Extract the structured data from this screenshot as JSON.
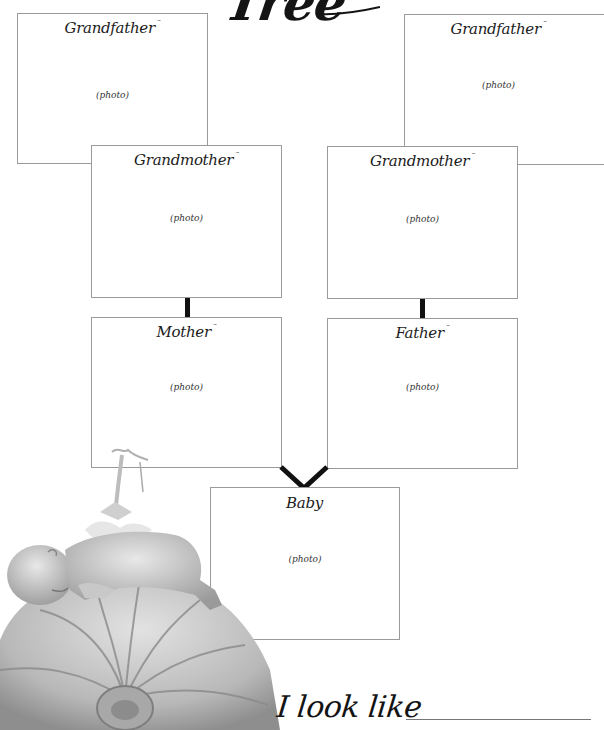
{
  "page": {
    "title": "Tree",
    "footer_prompt": "I look like"
  },
  "boxes": {
    "grandfather_left": {
      "label": "Grandfather",
      "placeholder": "(photo)"
    },
    "grandfather_right": {
      "label": "Grandfather",
      "placeholder": "(photo)"
    },
    "grandmother_left": {
      "label": "Grandmother",
      "placeholder": "(photo)"
    },
    "grandmother_right": {
      "label": "Grandmother",
      "placeholder": "(photo)"
    },
    "mother": {
      "label": "Mother",
      "placeholder": "(photo)"
    },
    "father": {
      "label": "Father",
      "placeholder": "(photo)"
    },
    "baby": {
      "label": "Baby",
      "placeholder": "(photo)"
    }
  },
  "illustration": {
    "subject": "baby-sleeping-on-pumpkin-photo"
  },
  "colors": {
    "border": "#9a9a9a",
    "connector": "#111111",
    "text": "#1c1c1c",
    "background": "#ffffff"
  }
}
